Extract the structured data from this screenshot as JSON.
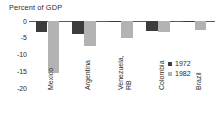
{
  "chart_data": {
    "type": "bar",
    "title": "Percent of GDP",
    "xlabel": "",
    "ylabel": "",
    "ylim": [
      -20,
      0
    ],
    "yticks": [
      0,
      -5,
      -10,
      -15,
      -20
    ],
    "ytick_labels": [
      "0",
      "-5",
      "-10",
      "-15",
      "-20"
    ],
    "grid": false,
    "legend_position": "right",
    "categories": [
      "Mexico",
      "Argentina",
      "Venezuela, RB",
      "Colombia",
      "Brazil"
    ],
    "category_lines": [
      [
        "Mexico"
      ],
      [
        "Argentina"
      ],
      [
        "Venezuela,",
        "RB"
      ],
      [
        "Colombia"
      ],
      [
        "Brazil"
      ]
    ],
    "series": [
      {
        "name": "1972",
        "color": "#3c3c3c",
        "values": [
          -3.3,
          -4.0,
          -0.4,
          -2.9,
          -0.4
        ]
      },
      {
        "name": "1982",
        "color": "#b3b3b3",
        "values": [
          -15.5,
          -7.6,
          -5.1,
          -3.3,
          -2.6
        ]
      }
    ]
  },
  "legend": {
    "items": [
      {
        "label": "1972",
        "swatch": "dark"
      },
      {
        "label": "1982",
        "swatch": "light"
      }
    ]
  },
  "axis": {
    "ticks": [
      {
        "label": "0",
        "value": 0
      },
      {
        "label": "-5",
        "value": -5
      },
      {
        "label": "-10",
        "value": -10
      },
      {
        "label": "-15",
        "value": -15
      },
      {
        "label": "-20",
        "value": -20
      }
    ]
  }
}
